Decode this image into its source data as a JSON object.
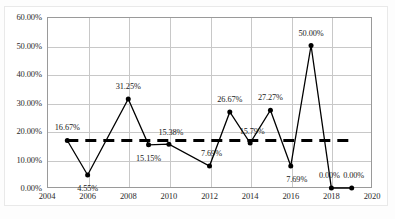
{
  "chart_data": {
    "type": "line",
    "title": "",
    "xlabel": "",
    "ylabel": "",
    "xlim": [
      2004,
      2020
    ],
    "ylim": [
      0,
      60
    ],
    "grid": true,
    "legend": "none",
    "y_ticks": [
      "0.00%",
      "10.00%",
      "20.00%",
      "30.00%",
      "40.00%",
      "50.00%",
      "60.00%"
    ],
    "y_tick_values": [
      0,
      10,
      20,
      30,
      40,
      50,
      60
    ],
    "x_ticks": [
      "2004",
      "2006",
      "2008",
      "2010",
      "2012",
      "2014",
      "2016",
      "2018",
      "2020"
    ],
    "x_tick_values": [
      2004,
      2006,
      2008,
      2010,
      2012,
      2014,
      2016,
      2018,
      2020
    ],
    "series": [
      {
        "name": "percentage",
        "x": [
          2005,
          2006,
          2008,
          2009,
          2010,
          2012,
          2013,
          2014,
          2015,
          2016,
          2017,
          2018,
          2019
        ],
        "values": [
          16.67,
          4.55,
          31.25,
          15.15,
          15.38,
          7.69,
          26.67,
          15.79,
          27.27,
          7.69,
          50.0,
          0.0,
          0.0
        ],
        "labels": [
          "16.67%",
          "4.55%",
          "31.25%",
          "15.15%",
          "15.38%",
          "7.69%",
          "26.67%",
          "15.79%",
          "27.27%",
          "7.69%",
          "50.00%",
          "0.00%",
          "0.00%"
        ],
        "color": "#000000",
        "marker": "circle",
        "style": "solid"
      },
      {
        "name": "reference-average",
        "x": [
          2005,
          2019
        ],
        "values": [
          16.67,
          16.67
        ],
        "labels": [],
        "color": "#000000",
        "marker": "none",
        "style": "dashed"
      }
    ],
    "label_offsets": [
      {
        "dx": 0,
        "dy": -13
      },
      {
        "dx": 0,
        "dy": 13
      },
      {
        "dx": 0,
        "dy": -13
      },
      {
        "dx": 0,
        "dy": 13
      },
      {
        "dx": 2,
        "dy": -12
      },
      {
        "dx": 2,
        "dy": -13
      },
      {
        "dx": 0,
        "dy": -13
      },
      {
        "dx": 2,
        "dy": -12
      },
      {
        "dx": 0,
        "dy": -13
      },
      {
        "dx": 6,
        "dy": 13
      },
      {
        "dx": 0,
        "dy": -13
      },
      {
        "dx": -2,
        "dy": -13
      },
      {
        "dx": 2,
        "dy": -13
      }
    ]
  }
}
